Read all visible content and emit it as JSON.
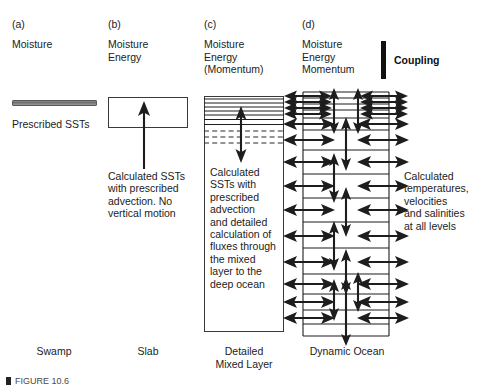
{
  "figure": {
    "type": "schematic-diagram",
    "background_color": "#ffffff",
    "ink_color": "#1d1d1d"
  },
  "columns": [
    {
      "letter": "(a)",
      "variables": "Moisture",
      "model_name": "Swamp",
      "description": "Prescribed SSTs",
      "representation": "thin-horizontal-bar"
    },
    {
      "letter": "(b)",
      "variables": "Moisture\nEnergy",
      "model_name": "Slab",
      "description": "Calculated SSTs\nwith prescribed\nadvection. No\nvertical motion",
      "representation": "single-layer-box-with-upward-arrow"
    },
    {
      "letter": "(c)",
      "variables": "Moisture\nEnergy\n(Momentum)",
      "model_name": "Detailed\nMixed Layer",
      "description": "Calculated\nSSTs with\nprescribed\nadvection\nand detailed\ncalculation of\nfluxes through\nthe mixed\nlayer to the\ndeep ocean",
      "representation": "layered-box-with-vertical-double-arrow",
      "solid_layer_count": 7,
      "dashed_layer_count": 3
    },
    {
      "letter": "(d)",
      "variables": "Moisture\nEnergy\nMomentum",
      "model_name": "Dynamic Ocean",
      "description": "Calculated\ntemperatures,\nvelocities\nand salinities\nat all levels",
      "representation": "multi-layer-box-with-horizontal-and-vertical-double-arrows",
      "layer_count": 15
    }
  ],
  "coupling": {
    "label": "Coupling",
    "marker": "thick-vertical-bar",
    "color": "#111111"
  },
  "caption": {
    "marker": "figure-bullet",
    "text": "FIGURE 10.6"
  }
}
